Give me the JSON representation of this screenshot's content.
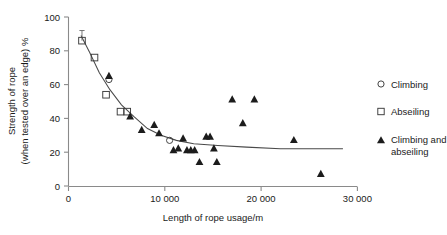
{
  "chart_data": {
    "type": "scatter",
    "title": "",
    "xlabel": "Length of rope usage/m",
    "ylabel_line1": "Strength of rope",
    "ylabel_line2": "(when tested over an edge) %",
    "xlim": [
      0,
      30000
    ],
    "ylim": [
      0,
      100
    ],
    "xticks": [
      0,
      10000,
      20000,
      30000
    ],
    "xtick_labels": [
      "0",
      "10 000",
      "20 000",
      "30 000"
    ],
    "yticks": [
      0,
      20,
      40,
      60,
      80,
      100
    ],
    "ytick_labels": [
      "0",
      "20",
      "40",
      "60",
      "80",
      "100"
    ],
    "grid": false,
    "legend_position": "right",
    "series": [
      {
        "name": "Climbing",
        "marker": "open-circle",
        "points": [
          {
            "x": 4200,
            "y": 63
          },
          {
            "x": 10500,
            "y": 27
          }
        ]
      },
      {
        "name": "Abseiling",
        "marker": "open-square",
        "points": [
          {
            "x": 1400,
            "y": 86,
            "error_high": 92,
            "error_low": 86
          },
          {
            "x": 2700,
            "y": 76
          },
          {
            "x": 3900,
            "y": 54
          },
          {
            "x": 5400,
            "y": 44
          },
          {
            "x": 6100,
            "y": 44
          }
        ]
      },
      {
        "name": "Climbing and abseiling",
        "marker": "filled-triangle",
        "points": [
          {
            "x": 4200,
            "y": 65
          },
          {
            "x": 6400,
            "y": 41
          },
          {
            "x": 7600,
            "y": 33
          },
          {
            "x": 8900,
            "y": 36
          },
          {
            "x": 9400,
            "y": 31
          },
          {
            "x": 10900,
            "y": 21
          },
          {
            "x": 11400,
            "y": 22
          },
          {
            "x": 11900,
            "y": 28
          },
          {
            "x": 12300,
            "y": 21
          },
          {
            "x": 12700,
            "y": 21
          },
          {
            "x": 13100,
            "y": 21
          },
          {
            "x": 13600,
            "y": 14
          },
          {
            "x": 14300,
            "y": 29
          },
          {
            "x": 14700,
            "y": 29
          },
          {
            "x": 15100,
            "y": 22
          },
          {
            "x": 15400,
            "y": 14
          },
          {
            "x": 17000,
            "y": 51
          },
          {
            "x": 19300,
            "y": 51
          },
          {
            "x": 18100,
            "y": 37
          },
          {
            "x": 23400,
            "y": 27
          },
          {
            "x": 26200,
            "y": 7
          }
        ]
      }
    ],
    "trend_line": {
      "description": "fitted decreasing curve",
      "points": [
        {
          "x": 1300,
          "y": 89
        },
        {
          "x": 2200,
          "y": 79
        },
        {
          "x": 3200,
          "y": 67
        },
        {
          "x": 4300,
          "y": 57
        },
        {
          "x": 5500,
          "y": 48
        },
        {
          "x": 6800,
          "y": 41
        },
        {
          "x": 8200,
          "y": 34
        },
        {
          "x": 9600,
          "y": 30
        },
        {
          "x": 11200,
          "y": 27
        },
        {
          "x": 13000,
          "y": 25
        },
        {
          "x": 15500,
          "y": 24
        },
        {
          "x": 18500,
          "y": 23
        },
        {
          "x": 22000,
          "y": 22
        },
        {
          "x": 26000,
          "y": 22
        },
        {
          "x": 28500,
          "y": 22
        }
      ]
    }
  },
  "legend": {
    "items": [
      {
        "label": "Climbing",
        "marker": "open-circle"
      },
      {
        "label": "Abseiling",
        "marker": "open-square"
      },
      {
        "label_line1": "Climbing and",
        "label_line2": "abseiling",
        "marker": "filled-triangle"
      }
    ]
  }
}
